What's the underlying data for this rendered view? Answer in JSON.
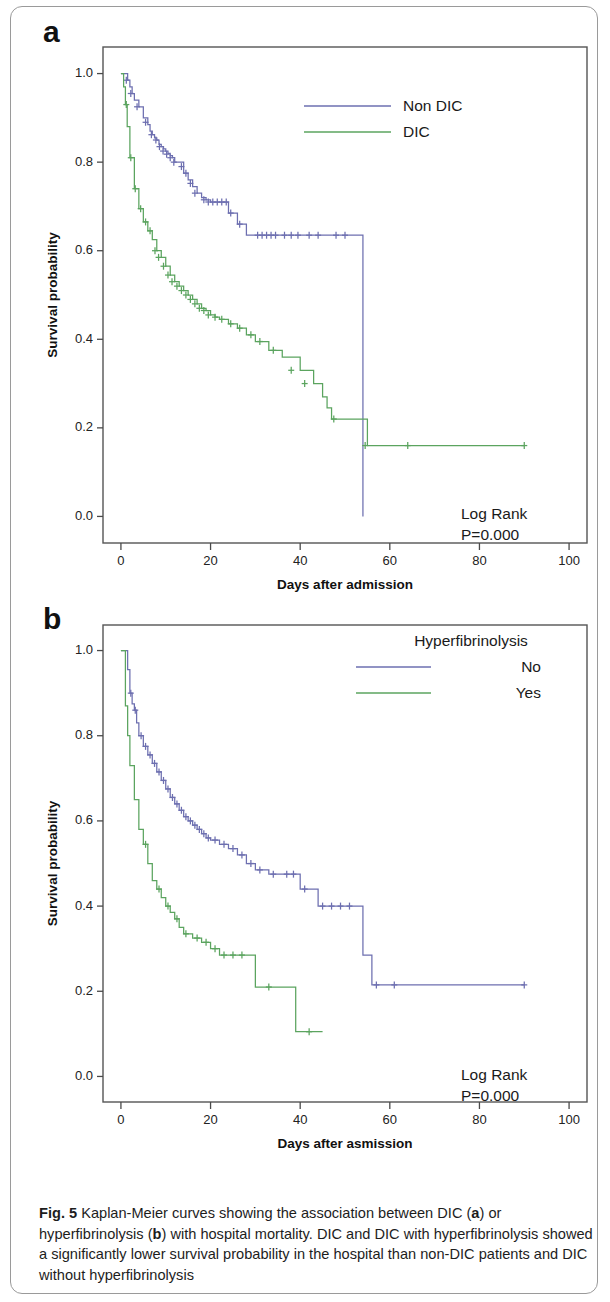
{
  "figure": {
    "panel_a_letter": "a",
    "panel_b_letter": "b",
    "caption_prefix": "Fig. 5",
    "caption_text": " Kaplan-Meier curves showing the association between DIC (a) or hyperfibrinolysis (b) with hospital mortality. DIC and DIC with hyperfibrinolysis showed a significantly lower survival probability in the hospital than non-DIC patients and DIC without hyperfibrinolysis",
    "caption_part1": " Kaplan-Meier curves showing the association between DIC (",
    "caption_bold_a": "a",
    "caption_part2": ") or hyperfibrinolysis (",
    "caption_bold_b": "b",
    "caption_part3": ") with hospital mortality. DIC and DIC with hyperfibrinolysis showed a significantly lower survival probability in the hospital than non-DIC patients and DIC without hyperfibrinolysis"
  },
  "colors": {
    "blue": "#6d6fb0",
    "green": "#5ba45f",
    "axis": "#4a4a4a",
    "text": "#1a1a1a"
  },
  "chart_data": [
    {
      "type": "line",
      "panel": "a",
      "title": "",
      "xlabel": "Days after admission",
      "ylabel": "Survival probability",
      "xlim": [
        -4,
        104
      ],
      "ylim": [
        -0.06,
        1.06
      ],
      "xticks": [
        0,
        20,
        40,
        60,
        80,
        100
      ],
      "xticklabels": [
        "0",
        "20",
        "40",
        "60",
        "80",
        "100"
      ],
      "yticks": [
        0.0,
        0.2,
        0.4,
        0.6,
        0.8,
        1.0
      ],
      "yticklabels": [
        "0.0",
        "0.2",
        "0.4",
        "0.6",
        "0.8",
        "1.0"
      ],
      "grid": false,
      "legend_position": "top-right",
      "legend": [
        "Non DIC",
        "DIC"
      ],
      "annotations": [
        "Log Rank",
        "P=0.000"
      ],
      "series": [
        {
          "name": "Non DIC",
          "color": "#6d6fb0",
          "x": [
            0,
            1,
            1.5,
            2,
            2.5,
            3,
            3.5,
            4,
            5,
            6,
            6.5,
            7,
            7.5,
            8,
            8.5,
            9,
            9.5,
            10,
            10.5,
            11,
            11.5,
            12,
            13,
            14,
            15,
            16,
            17,
            18,
            19,
            20,
            21,
            22,
            23,
            24,
            26,
            28,
            30,
            54,
            54
          ],
          "y": [
            1.0,
            1.0,
            0.985,
            0.97,
            0.955,
            0.94,
            0.94,
            0.925,
            0.9,
            0.885,
            0.87,
            0.862,
            0.855,
            0.85,
            0.84,
            0.835,
            0.83,
            0.825,
            0.82,
            0.815,
            0.81,
            0.8,
            0.8,
            0.775,
            0.76,
            0.745,
            0.73,
            0.72,
            0.715,
            0.71,
            0.71,
            0.71,
            0.71,
            0.685,
            0.66,
            0.635,
            0.635,
            0.635,
            0.0
          ],
          "censor_x": [
            1.2,
            2.2,
            3.6,
            5.5,
            6.8,
            7.8,
            8.6,
            9.4,
            10.2,
            11.0,
            11.8,
            13.5,
            14.5,
            15.5,
            16.5,
            18.5,
            19.5,
            20.5,
            21.5,
            22.5,
            23.5,
            24.5,
            26.5,
            30.5,
            31.5,
            32.5,
            33.5,
            34.5,
            36.5,
            38.0,
            39.5,
            42.0,
            44.0,
            48.0,
            50.0
          ],
          "censor_y": [
            0.985,
            0.955,
            0.925,
            0.89,
            0.862,
            0.85,
            0.835,
            0.825,
            0.818,
            0.81,
            0.8,
            0.79,
            0.775,
            0.752,
            0.73,
            0.715,
            0.71,
            0.71,
            0.71,
            0.71,
            0.71,
            0.685,
            0.66,
            0.635,
            0.635,
            0.635,
            0.635,
            0.635,
            0.635,
            0.635,
            0.635,
            0.635,
            0.635,
            0.635,
            0.635
          ],
          "final_x": 54,
          "final_y": 0.0,
          "note": "drops vertically to zero at day 54"
        },
        {
          "name": "DIC",
          "color": "#5ba45f",
          "x": [
            0,
            0.6,
            1.0,
            1.4,
            2.0,
            3.0,
            4.0,
            5.0,
            6.0,
            7.0,
            8.0,
            9.0,
            10.0,
            11.0,
            12.0,
            13.0,
            14.0,
            15.0,
            16.0,
            17.0,
            18.0,
            19.0,
            20.0,
            21.0,
            22.0,
            24.0,
            26.0,
            28.0,
            30.0,
            33.0,
            36.0,
            40.0,
            43.0,
            45.0,
            46.0,
            47.0,
            48.0,
            54.0,
            55.0,
            90.0
          ],
          "y": [
            1.0,
            0.97,
            0.93,
            0.88,
            0.81,
            0.74,
            0.695,
            0.665,
            0.645,
            0.625,
            0.6,
            0.585,
            0.565,
            0.545,
            0.53,
            0.52,
            0.51,
            0.5,
            0.49,
            0.48,
            0.47,
            0.465,
            0.455,
            0.45,
            0.445,
            0.435,
            0.425,
            0.41,
            0.395,
            0.375,
            0.36,
            0.33,
            0.3,
            0.27,
            0.245,
            0.22,
            0.22,
            0.22,
            0.16,
            0.16
          ],
          "censor_x": [
            1.2,
            2.2,
            3.2,
            4.4,
            5.5,
            6.5,
            7.6,
            8.4,
            9.5,
            10.5,
            11.4,
            12.5,
            13.5,
            14.5,
            15.5,
            16.5,
            17.5,
            18.5,
            19.5,
            21.0,
            22.5,
            24.5,
            26.5,
            29.0,
            31.0,
            34.0,
            38.0,
            41.0,
            47.5,
            54.5,
            64.0,
            90.0
          ],
          "censor_y": [
            0.93,
            0.81,
            0.74,
            0.695,
            0.665,
            0.645,
            0.6,
            0.585,
            0.565,
            0.545,
            0.53,
            0.52,
            0.51,
            0.5,
            0.49,
            0.48,
            0.47,
            0.465,
            0.455,
            0.45,
            0.445,
            0.435,
            0.425,
            0.41,
            0.395,
            0.375,
            0.33,
            0.3,
            0.22,
            0.16,
            0.16,
            0.16
          ],
          "final_x": 90,
          "final_y": 0.16,
          "note": "plateau at 0.22 then 0.16 after day 55"
        }
      ]
    },
    {
      "type": "line",
      "panel": "b",
      "title": "",
      "xlabel": "Days after asmission",
      "ylabel": "Survival probability",
      "xlim": [
        -4,
        104
      ],
      "ylim": [
        -0.06,
        1.06
      ],
      "xticks": [
        0,
        20,
        40,
        60,
        80,
        100
      ],
      "xticklabels": [
        "0",
        "20",
        "40",
        "60",
        "80",
        "100"
      ],
      "yticks": [
        0.0,
        0.2,
        0.4,
        0.6,
        0.8,
        1.0
      ],
      "yticklabels": [
        "0.0",
        "0.2",
        "0.4",
        "0.6",
        "0.8",
        "1.0"
      ],
      "grid": false,
      "legend_position": "top-right",
      "legend_title": "Hyperfibrinolysis",
      "legend": [
        "No",
        "Yes"
      ],
      "annotations": [
        "Log Rank",
        "P=0.000"
      ],
      "series": [
        {
          "name": "No",
          "color": "#6d6fb0",
          "x": [
            0,
            0.8,
            1.5,
            2.0,
            2.5,
            3.0,
            3.5,
            4.0,
            5.0,
            6.0,
            7.0,
            8.0,
            9.0,
            10.0,
            11.0,
            12.0,
            13.0,
            14.0,
            15.0,
            16.0,
            17.0,
            18.0,
            19.0,
            20.0,
            22.0,
            24.0,
            26.0,
            28.0,
            30.0,
            33.0,
            36.0,
            40.0,
            44.0,
            46.0,
            54.0,
            56.0,
            90.0
          ],
          "y": [
            1.0,
            1.0,
            0.955,
            0.9,
            0.875,
            0.86,
            0.83,
            0.8,
            0.775,
            0.755,
            0.735,
            0.715,
            0.695,
            0.675,
            0.655,
            0.64,
            0.625,
            0.61,
            0.6,
            0.59,
            0.58,
            0.57,
            0.56,
            0.555,
            0.545,
            0.535,
            0.52,
            0.5,
            0.485,
            0.475,
            0.475,
            0.44,
            0.4,
            0.4,
            0.285,
            0.215,
            0.215
          ],
          "censor_x": [
            2.2,
            3.2,
            4.5,
            5.5,
            6.5,
            7.5,
            8.5,
            9.5,
            10.5,
            11.5,
            12.5,
            13.5,
            14.5,
            15.5,
            16.5,
            17.5,
            18.5,
            19.5,
            21.0,
            23.0,
            25.0,
            27.0,
            29.0,
            31.0,
            34.0,
            37.0,
            38.5,
            41.0,
            45.0,
            47.0,
            49.0,
            51.0,
            57.0,
            61.0,
            90.0
          ],
          "censor_y": [
            0.9,
            0.86,
            0.8,
            0.775,
            0.755,
            0.735,
            0.715,
            0.695,
            0.675,
            0.655,
            0.64,
            0.625,
            0.61,
            0.6,
            0.59,
            0.58,
            0.57,
            0.56,
            0.555,
            0.545,
            0.535,
            0.52,
            0.5,
            0.485,
            0.475,
            0.475,
            0.475,
            0.44,
            0.4,
            0.4,
            0.4,
            0.4,
            0.215,
            0.215,
            0.215
          ],
          "final_x": 90,
          "final_y": 0.215,
          "note": "plateau at 0.215 to day 90"
        },
        {
          "name": "Yes",
          "color": "#5ba45f",
          "x": [
            0,
            0.5,
            1.0,
            1.5,
            2.0,
            2.5,
            3.0,
            4.0,
            5.0,
            6.0,
            7.0,
            8.0,
            9.0,
            10.0,
            11.0,
            12.0,
            13.0,
            14.0,
            16.0,
            18.0,
            20.0,
            22.0,
            24.0,
            26.0,
            28.0,
            30.0,
            38.0,
            39.0,
            45.0
          ],
          "y": [
            1.0,
            1.0,
            0.87,
            0.8,
            0.73,
            0.73,
            0.65,
            0.58,
            0.545,
            0.5,
            0.46,
            0.44,
            0.42,
            0.4,
            0.385,
            0.37,
            0.35,
            0.335,
            0.325,
            0.315,
            0.3,
            0.285,
            0.285,
            0.285,
            0.285,
            0.21,
            0.21,
            0.105,
            0.105
          ],
          "censor_x": [
            5.5,
            8.5,
            10.5,
            12.5,
            14.5,
            17.0,
            19.0,
            21.0,
            23.0,
            25.0,
            27.0,
            33.0,
            42.0
          ],
          "censor_y": [
            0.545,
            0.44,
            0.4,
            0.37,
            0.335,
            0.325,
            0.315,
            0.3,
            0.285,
            0.285,
            0.285,
            0.21,
            0.105
          ],
          "final_x": 45,
          "final_y": 0.105,
          "note": "ends at 0.105 around day 45"
        }
      ]
    }
  ]
}
